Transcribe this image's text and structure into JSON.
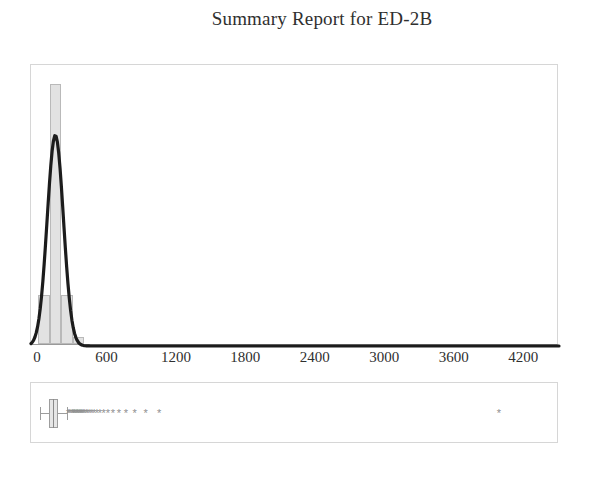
{
  "report": {
    "title": "Summary Report for ED-2B"
  },
  "chart_data": {
    "type": "histogram",
    "title": "Summary Report for ED-2B",
    "xlabel": "",
    "ylabel": "",
    "xlim": [
      -60,
      4500
    ],
    "grid": false,
    "legend": false,
    "axis": {
      "tick_labels": [
        "0",
        "600",
        "1200",
        "1800",
        "2400",
        "3000",
        "3600",
        "4200"
      ],
      "tick_values": [
        0,
        600,
        1200,
        1800,
        2400,
        3000,
        3600,
        4200
      ]
    },
    "histogram": {
      "bin_width": 100,
      "bin_starts": [
        0,
        100,
        200,
        300
      ],
      "counts": [
        14,
        74,
        14,
        2
      ],
      "ylim": [
        0,
        80
      ],
      "bar_fill": "#e2e2e2",
      "bar_edge": "#b9b9b9"
    },
    "fit_curve": {
      "label": "normal fit",
      "color": "#1c1c1c",
      "mean": 150,
      "stdev": 70,
      "peak_count": 60
    },
    "boxplot": {
      "orientation": "horizontal",
      "whisker_low": 20,
      "q1": 95,
      "median": 130,
      "q3": 175,
      "whisker_high": 250,
      "outliers": [
        260,
        272,
        285,
        297,
        305,
        312,
        320,
        329,
        338,
        346,
        355,
        364,
        372,
        381,
        392,
        404,
        418,
        432,
        448,
        466,
        486,
        508,
        536,
        568,
        604,
        648,
        700,
        760,
        836,
        930,
        1046,
        3980
      ],
      "box_fill": "#e6e6e6",
      "box_edge": "#9d9d9d",
      "outlier_glyph": "*"
    }
  }
}
